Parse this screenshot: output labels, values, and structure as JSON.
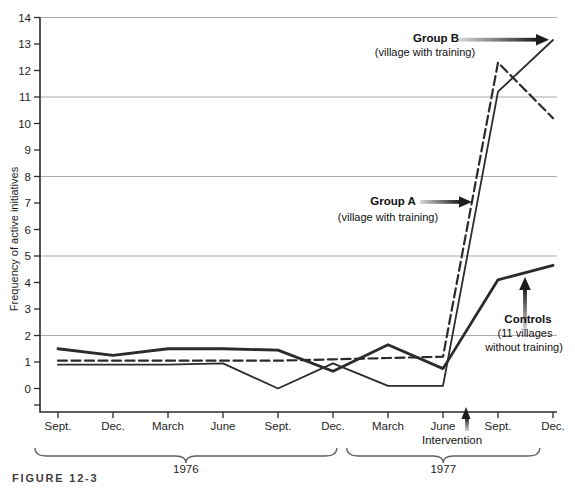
{
  "chart_data": {
    "type": "line",
    "title": "",
    "ylabel": "Frequency of active initiatives",
    "ylim": [
      0,
      14
    ],
    "grid": "horizontal lines at 2,5,8,11,14 only",
    "gridlines_at": [
      2,
      5,
      8,
      11,
      14
    ],
    "legend_position": "none (labels annotated with arrows on plot)",
    "categories": [
      "Sept.",
      "Dec.",
      "March",
      "June",
      "Sept.",
      "Dec.",
      "March",
      "June",
      "Sept.",
      "Dec."
    ],
    "series": [
      {
        "name": "Group B",
        "style": "solid-thin",
        "values": [
          0.9,
          0.9,
          0.9,
          0.95,
          0.0,
          0.95,
          0.1,
          0.1,
          11.2,
          13.15
        ]
      },
      {
        "name": "Controls",
        "style": "solid-thick",
        "values": [
          1.5,
          1.25,
          1.5,
          1.5,
          1.45,
          0.65,
          1.65,
          0.75,
          4.1,
          4.65
        ]
      },
      {
        "name": "Group A",
        "style": "dashed",
        "values": [
          1.05,
          1.05,
          1.05,
          1.05,
          1.05,
          1.1,
          1.15,
          1.2,
          12.3,
          10.2
        ]
      }
    ],
    "x_groups": [
      {
        "label": "1976",
        "from_tick": -0.42,
        "to_tick": 5.07
      },
      {
        "label": "1977",
        "from_tick": 5.25,
        "to_tick": 8.76
      }
    ],
    "intervention": {
      "label": "Intervention",
      "x_tick_position": 7.44
    }
  },
  "annotations": {
    "group_b": {
      "title": "Group B",
      "subtitle": "(village with training)"
    },
    "group_a": {
      "title": "Group A",
      "subtitle": "(village with training)"
    },
    "controls": {
      "title": "Controls",
      "line1": "(11 villages",
      "line2": "without training)"
    },
    "intervention_label": "Intervention",
    "figure_label": "FIGURE 12-3"
  },
  "colors": {
    "ink": "#2b2b2b",
    "grid": "#ababab",
    "arrow_dark": "#1c1c1c",
    "arrow_light": "#d6d6d6"
  }
}
